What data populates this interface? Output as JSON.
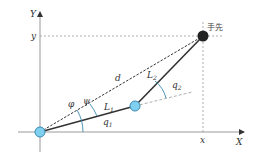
{
  "diagram": {
    "axes": {
      "x_label": "X",
      "y_label": "Y",
      "x_coord_label": "x",
      "y_coord_label": "y"
    },
    "links": [
      {
        "name": "L",
        "subscript": "1"
      },
      {
        "name": "L",
        "subscript": "2"
      }
    ],
    "angles": [
      {
        "name": "q",
        "subscript": "1"
      },
      {
        "name": "q",
        "subscript": "2"
      },
      {
        "name": "φ"
      },
      {
        "name": "ψ"
      }
    ],
    "distance_label": "d",
    "end_effector_label": "手先",
    "colors": {
      "joint_fill": "#7fd0f0",
      "joint_stroke": "#3a8ab0",
      "angle_arc": "#3a8ab0",
      "end_effector": "#222222",
      "axis": "#888888"
    }
  }
}
